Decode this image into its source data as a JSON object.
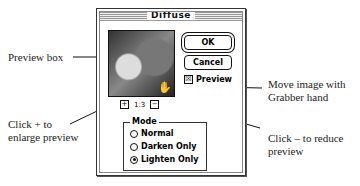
{
  "dialog": {
    "title": "Diffuse",
    "ok_label": "OK",
    "cancel_label": "Cancel",
    "preview_checkbox": {
      "label": "Preview",
      "checked": true,
      "mark": "☒"
    },
    "zoom": {
      "plus": "+",
      "minus": "−",
      "level": "1:3"
    },
    "mode": {
      "label": "Mode",
      "options": [
        {
          "label": "Normal",
          "selected": false
        },
        {
          "label": "Darken Only",
          "selected": false
        },
        {
          "label": "Lighten Only",
          "selected": true
        }
      ]
    },
    "hand_icon": "✋"
  },
  "callouts": {
    "preview_box": "Preview box",
    "click_plus": [
      "Click + to",
      "enlarge preview"
    ],
    "grabber": [
      "Move image with",
      "Grabber hand"
    ],
    "click_minus": [
      "Click – to reduce",
      "preview"
    ]
  }
}
